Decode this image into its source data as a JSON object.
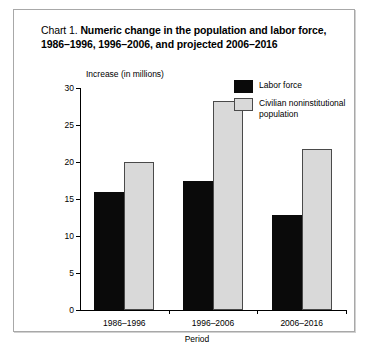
{
  "title": {
    "prefix": "Chart 1.",
    "body": "Numeric change in the population and labor force, 1986–1996, 1996–2006, and projected 2006–2016"
  },
  "legend": {
    "items": [
      {
        "label": "Labor force",
        "color": "#0a0a0a",
        "key": "labor"
      },
      {
        "label": "Civilian noninstitutional population",
        "color": "#d9d9d9",
        "key": "civilian"
      }
    ]
  },
  "axes": {
    "y_caption": "Increase (in millions)",
    "x_caption": "Period",
    "y_ticks": [
      "0",
      "5",
      "10",
      "15",
      "20",
      "25",
      "30"
    ]
  },
  "chart_data": {
    "type": "bar",
    "title": "Chart 1. Numeric change in the population and labor force, 1986–1996, 1996–2006, and projected 2006–2016",
    "xlabel": "Period",
    "ylabel": "Increase (in millions)",
    "ylim": [
      0,
      30
    ],
    "ytick_step": 5,
    "grid": false,
    "legend_position": "top-right",
    "categories": [
      "1986–1996",
      "1996–2006",
      "2006–2016"
    ],
    "series": [
      {
        "name": "Labor force",
        "color": "#0a0a0a",
        "values": [
          16.0,
          17.5,
          12.8
        ]
      },
      {
        "name": "Civilian noninstitutional population",
        "color": "#d9d9d9",
        "values": [
          20.0,
          28.3,
          21.8
        ]
      }
    ]
  }
}
